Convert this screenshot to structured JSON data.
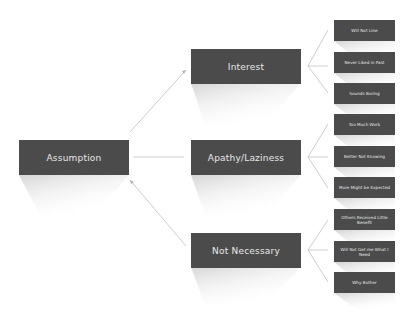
{
  "diagram": {
    "root": {
      "label": "Assumption"
    },
    "branches": [
      {
        "label": "Interest",
        "children": [
          "Will Not Line",
          "Never Liked in Past",
          "Sounds Boring"
        ]
      },
      {
        "label": "Apathy/Laziness",
        "children": [
          "Too Much Work",
          "Better Not Knowing",
          "More Might be Expected"
        ]
      },
      {
        "label": "Not Necessary",
        "children": [
          "Others Received Little Benefit",
          "Will Not Get me What I Need",
          "Why Bother"
        ]
      }
    ],
    "colors": {
      "box": "#4b4b4b",
      "text": "#e8e8e8",
      "connector": "#c8c8c8",
      "background": "#ffffff"
    }
  }
}
